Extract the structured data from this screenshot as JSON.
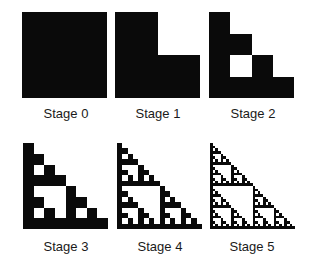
{
  "figure": {
    "fill_color": "#0a0a0a",
    "background_color": "#ffffff",
    "stages": [
      {
        "label": "Stage 0",
        "level": 0
      },
      {
        "label": "Stage 1",
        "level": 1
      },
      {
        "label": "Stage 2",
        "level": 2
      },
      {
        "label": "Stage 3",
        "level": 3
      },
      {
        "label": "Stage 4",
        "level": 4
      },
      {
        "label": "Stage 5",
        "level": 5
      }
    ]
  }
}
